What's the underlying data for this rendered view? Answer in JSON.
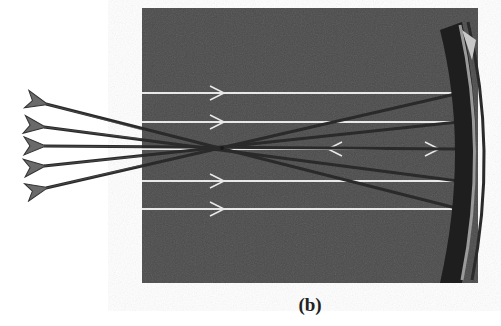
{
  "figure": {
    "caption": "(b)",
    "colors": {
      "background": "#ffffff",
      "photo_bg": "#4a4a4a",
      "incident_ray": "#e8e8e8",
      "reflected_ray": "#2a2a2a",
      "arrow_fill": "#666666",
      "mirror": "#1e1e1e"
    },
    "photo": {
      "x": 142,
      "y": 8,
      "width": 336,
      "height": 275
    },
    "focal_point": {
      "x": 222,
      "y": 148
    },
    "incident_rays_y": [
      93,
      122,
      149,
      181,
      209
    ],
    "mirror_hits": [
      {
        "x": 460,
        "y": 93
      },
      {
        "x": 458,
        "y": 122
      },
      {
        "x": 457,
        "y": 149
      },
      {
        "x": 458,
        "y": 181
      },
      {
        "x": 460,
        "y": 209
      }
    ],
    "reflected_arrow_tips": [
      {
        "x": 28,
        "y": 102
      },
      {
        "x": 26,
        "y": 127
      },
      {
        "x": 26,
        "y": 146
      },
      {
        "x": 26,
        "y": 168
      },
      {
        "x": 28,
        "y": 190
      }
    ]
  }
}
